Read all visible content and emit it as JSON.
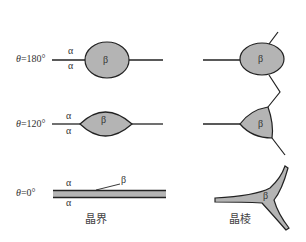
{
  "rows": [
    {
      "theta_symbol": "θ",
      "theta_value": "=180°",
      "alpha_top": "α",
      "alpha_bottom": "α",
      "beta_left": "β",
      "beta_right": "β"
    },
    {
      "theta_symbol": "θ",
      "theta_value": "=120°",
      "alpha_top": "α",
      "alpha_bottom": "α",
      "beta_left": "β",
      "beta_right": "β"
    },
    {
      "theta_symbol": "θ",
      "theta_value": "=0°",
      "alpha_top": "α",
      "alpha_bottom": "α",
      "beta_left": "β",
      "beta_right": "β"
    }
  ],
  "captions": {
    "grain_boundary": "晶界",
    "grain_edge": "晶棱"
  },
  "colors": {
    "phase_fill": "#b4b4b4",
    "line": "#222222",
    "background": "#ffffff"
  }
}
